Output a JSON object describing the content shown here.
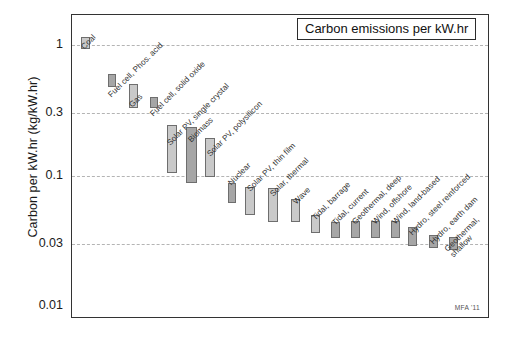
{
  "figure": {
    "title": "Carbon emissions per kW.hr",
    "watermark": "MFA '11",
    "y_axis_title": "Carbon per kW.hr (kg/kW.hr)"
  },
  "chart_data": {
    "type": "bar",
    "title": "Carbon emissions per kW.hr",
    "subtitle": "",
    "xlabel": "",
    "ylabel": "Carbon per kW.hr (kg/kW.hr)",
    "yscale": "log",
    "ylim": [
      0.01,
      2.0
    ],
    "ytick_labels": [
      "1",
      "0.3",
      "0.1",
      "0.03",
      "0.01"
    ],
    "ytick_values": [
      1,
      0.3,
      0.1,
      0.03,
      0.01
    ],
    "gridlines": [
      1,
      0.3,
      0.1,
      0.03
    ],
    "grid": true,
    "legend": "none",
    "note": "Each bar is a low-to-high range (floating bar) of carbon emitted per kW.hr of electricity generated.",
    "categories": [
      "Coal",
      "Fuel cell, Phos. acid",
      "Gas",
      "Fuel cell, solid oxide",
      "Solar PV, single crystal",
      "Biomass",
      "Solar PV, polysilicon",
      "Nuclear",
      "Solar PV, thin film",
      "Solar, thermal",
      "Wave",
      "Tidal, barrage",
      "Tidal, current",
      "Geothermal, deep",
      "Wind, offshore",
      "Wind, land-based",
      "Hydro, steel reinforced",
      "Hydro, earth dam",
      "Geothermal, shallow"
    ],
    "ranges": [
      {
        "name": "Coal",
        "low": 0.93,
        "high": 1.15
      },
      {
        "name": "Fuel cell, Phos. acid",
        "low": 0.48,
        "high": 0.6
      },
      {
        "name": "Gas",
        "low": 0.33,
        "high": 0.5
      },
      {
        "name": "Fuel cell, solid oxide",
        "low": 0.33,
        "high": 0.4
      },
      {
        "name": "Solar PV, single crystal",
        "low": 0.105,
        "high": 0.245
      },
      {
        "name": "Biomass",
        "low": 0.088,
        "high": 0.235
      },
      {
        "name": "Solar PV, polysilicon",
        "low": 0.098,
        "high": 0.195
      },
      {
        "name": "Nuclear",
        "low": 0.062,
        "high": 0.088
      },
      {
        "name": "Solar PV, thin film",
        "low": 0.05,
        "high": 0.082
      },
      {
        "name": "Solar, thermal",
        "low": 0.044,
        "high": 0.08
      },
      {
        "name": "Wave",
        "low": 0.044,
        "high": 0.066
      },
      {
        "name": "Tidal, barrage",
        "low": 0.036,
        "high": 0.05
      },
      {
        "name": "Tidal, current",
        "low": 0.033,
        "high": 0.044
      },
      {
        "name": "Geothermal, deep",
        "low": 0.033,
        "high": 0.045
      },
      {
        "name": "Wind, offshore",
        "low": 0.033,
        "high": 0.045
      },
      {
        "name": "Wind, land-based",
        "low": 0.033,
        "high": 0.045
      },
      {
        "name": "Hydro, steel reinforced",
        "low": 0.029,
        "high": 0.04
      },
      {
        "name": "Hydro, earth dam",
        "low": 0.028,
        "high": 0.035
      },
      {
        "name": "Geothermal, shallow",
        "low": 0.027,
        "high": 0.034
      }
    ]
  },
  "style": {
    "bar_fill_light": "#c9c9c9",
    "bar_fill_dark": "#a6a6a6",
    "bar_border": "#6e6e6e",
    "grid_color": "#b4b4b4",
    "frame_color": "#333333",
    "text_color": "#1a1a1a"
  }
}
